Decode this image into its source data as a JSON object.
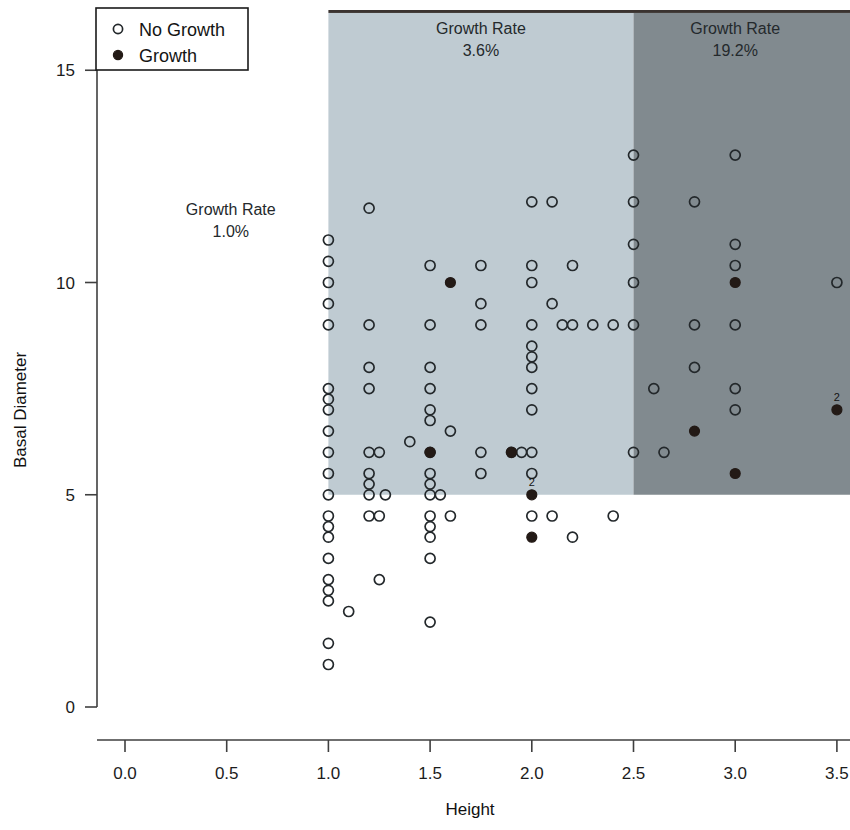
{
  "chart_data": {
    "type": "scatter",
    "title": "",
    "xlabel": "Height",
    "ylabel": "Basal Diameter",
    "xlim": [
      -0.22,
      3.62
    ],
    "ylim": [
      -0.45,
      16.6
    ],
    "xticks": [
      "0.0",
      "0.5",
      "1.0",
      "1.5",
      "2.0",
      "2.5",
      "3.0",
      "3.5"
    ],
    "xtick_values": [
      0.0,
      0.5,
      1.0,
      1.5,
      2.0,
      2.5,
      3.0,
      3.5
    ],
    "yticks": [
      "0",
      "5",
      "10",
      "15"
    ],
    "ytick_values": [
      0,
      5,
      10,
      15
    ],
    "grid": false,
    "legend_position": "top-left",
    "legend": [
      {
        "label": "No Growth",
        "marker": "open-circle"
      },
      {
        "label": "Growth",
        "marker": "filled-circle"
      }
    ],
    "annotations": [
      {
        "name": "growth-rate-left",
        "line1": "Growth Rate",
        "line2": "1.0%",
        "x": 0.52,
        "y": 11.6
      },
      {
        "name": "growth-rate-middle",
        "line1": "Growth Rate",
        "line2": "3.6%",
        "x": 1.75,
        "y": 15.85
      },
      {
        "name": "growth-rate-right",
        "line1": "Growth Rate",
        "line2": "19.2%",
        "x": 3.0,
        "y": 15.85
      }
    ],
    "shaded_regions": [
      {
        "name": "light-region",
        "color": "#bfcbd2",
        "x0": 1.0,
        "x1": 2.5,
        "y0": 5.0,
        "y1": 16.35
      },
      {
        "name": "dark-region",
        "color": "#818a8f",
        "x0": 2.5,
        "x1": 3.62,
        "y0": 5.0,
        "y1": 16.35
      },
      {
        "name": "top-band",
        "color": "#3a3330",
        "x0": 1.0,
        "x1": 3.62,
        "y0": 16.35,
        "y1": 16.6
      }
    ],
    "series": [
      {
        "name": "No Growth",
        "marker": "open-circle",
        "points": [
          [
            1.0,
            11.0
          ],
          [
            1.0,
            10.5
          ],
          [
            1.0,
            10.0
          ],
          [
            1.0,
            9.5
          ],
          [
            1.0,
            9.0
          ],
          [
            1.0,
            7.5
          ],
          [
            1.0,
            7.25
          ],
          [
            1.0,
            7.0
          ],
          [
            1.0,
            6.5
          ],
          [
            1.0,
            6.0
          ],
          [
            1.0,
            5.5
          ],
          [
            1.0,
            5.0
          ],
          [
            1.0,
            4.5
          ],
          [
            1.0,
            4.25
          ],
          [
            1.0,
            4.0
          ],
          [
            1.0,
            3.5
          ],
          [
            1.0,
            3.0
          ],
          [
            1.0,
            2.75
          ],
          [
            1.0,
            2.5
          ],
          [
            1.0,
            1.5
          ],
          [
            1.0,
            1.0
          ],
          [
            1.1,
            2.25
          ],
          [
            1.2,
            11.75
          ],
          [
            1.2,
            9.0
          ],
          [
            1.2,
            8.0
          ],
          [
            1.2,
            7.5
          ],
          [
            1.2,
            6.0
          ],
          [
            1.2,
            5.5
          ],
          [
            1.2,
            5.25
          ],
          [
            1.2,
            5.0
          ],
          [
            1.2,
            4.5
          ],
          [
            1.25,
            4.5
          ],
          [
            1.25,
            3.0
          ],
          [
            1.25,
            6.0
          ],
          [
            1.28,
            5.0
          ],
          [
            1.4,
            6.25
          ],
          [
            1.5,
            10.4
          ],
          [
            1.5,
            9.0
          ],
          [
            1.5,
            8.0
          ],
          [
            1.5,
            7.5
          ],
          [
            1.5,
            7.0
          ],
          [
            1.5,
            6.75
          ],
          [
            1.5,
            6.0
          ],
          [
            1.5,
            5.5
          ],
          [
            1.5,
            5.25
          ],
          [
            1.5,
            5.0
          ],
          [
            1.5,
            4.5
          ],
          [
            1.5,
            4.25
          ],
          [
            1.5,
            4.0
          ],
          [
            1.5,
            3.5
          ],
          [
            1.5,
            2.0
          ],
          [
            1.55,
            5.0
          ],
          [
            1.6,
            6.5
          ],
          [
            1.6,
            4.5
          ],
          [
            1.75,
            10.4
          ],
          [
            1.75,
            9.0
          ],
          [
            1.75,
            9.5
          ],
          [
            1.75,
            5.5
          ],
          [
            1.75,
            6.0
          ],
          [
            1.9,
            6.0
          ],
          [
            1.95,
            6.0
          ],
          [
            2.0,
            11.9
          ],
          [
            2.0,
            10.4
          ],
          [
            2.0,
            10.0
          ],
          [
            2.0,
            9.0
          ],
          [
            2.0,
            8.5
          ],
          [
            2.0,
            8.25
          ],
          [
            2.0,
            8.0
          ],
          [
            2.0,
            7.5
          ],
          [
            2.0,
            7.0
          ],
          [
            2.0,
            6.0
          ],
          [
            2.0,
            5.5
          ],
          [
            2.0,
            4.5
          ],
          [
            2.1,
            11.9
          ],
          [
            2.1,
            9.5
          ],
          [
            2.15,
            9.0
          ],
          [
            2.1,
            4.5
          ],
          [
            2.2,
            10.4
          ],
          [
            2.2,
            9.0
          ],
          [
            2.2,
            4.0
          ],
          [
            2.3,
            9.0
          ],
          [
            2.4,
            9.0
          ],
          [
            2.4,
            4.5
          ],
          [
            2.5,
            13.0
          ],
          [
            2.5,
            11.9
          ],
          [
            2.5,
            10.9
          ],
          [
            2.5,
            10.0
          ],
          [
            2.5,
            9.0
          ],
          [
            2.5,
            6.0
          ],
          [
            2.6,
            7.5
          ],
          [
            2.65,
            6.0
          ],
          [
            2.8,
            11.9
          ],
          [
            2.8,
            9.0
          ],
          [
            2.8,
            8.0
          ],
          [
            3.0,
            13.0
          ],
          [
            3.0,
            10.9
          ],
          [
            3.0,
            10.4
          ],
          [
            3.0,
            9.0
          ],
          [
            3.0,
            7.5
          ],
          [
            3.0,
            7.0
          ],
          [
            3.5,
            10.0
          ]
        ]
      },
      {
        "name": "Growth",
        "marker": "filled-circle",
        "points": [
          [
            1.5,
            6.0
          ],
          [
            1.6,
            10.0
          ],
          [
            1.9,
            6.0
          ],
          [
            2.0,
            5.0
          ],
          [
            2.0,
            4.0
          ],
          [
            2.8,
            6.5
          ],
          [
            3.0,
            10.0
          ],
          [
            3.0,
            5.5
          ],
          [
            3.5,
            7.0
          ]
        ]
      }
    ],
    "point_count_labels": [
      {
        "text": "2",
        "x": 2.0,
        "y": 5.0
      },
      {
        "text": "2",
        "x": 3.5,
        "y": 7.0
      }
    ],
    "colors": {
      "light_region": "#bfcbd2",
      "dark_region": "#818a8f",
      "top_band": "#3a3330",
      "marker_open": "#23282b",
      "marker_filled": "#231a16",
      "axis": "#3f3f3f",
      "background": "#ffffff"
    }
  }
}
